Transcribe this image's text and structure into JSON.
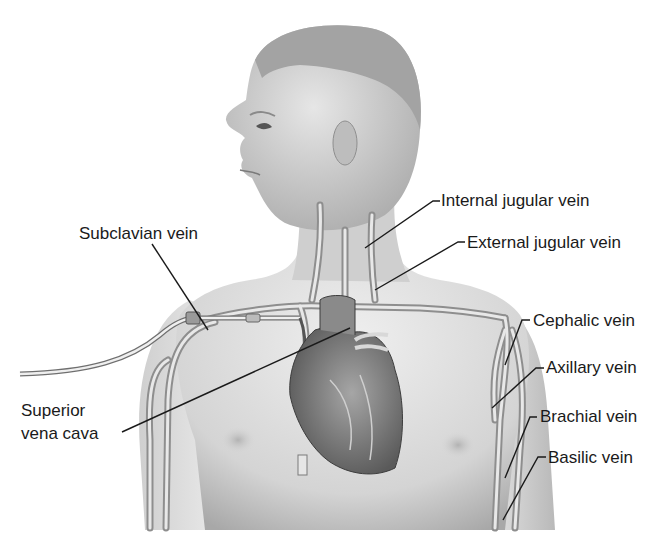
{
  "diagram": {
    "labels": {
      "internal_jugular": "Internal jugular vein",
      "external_jugular": "External jugular vein",
      "subclavian": "Subclavian vein",
      "cephalic": "Cephalic vein",
      "axillary": "Axillary vein",
      "superior_vena_cava_line1": "Superior",
      "superior_vena_cava_line2": "vena cava",
      "brachial": "Brachial vein",
      "basilic": "Basilic vein"
    },
    "colors": {
      "skin_light": "#e4e4e4",
      "skin_mid": "#bdbdbd",
      "skin_dark": "#8a8a8a",
      "vein": "#9c9c9c",
      "heart": "#7d7d7d",
      "leader_line": "#1a1a1a",
      "text": "#1a1a1a"
    }
  }
}
